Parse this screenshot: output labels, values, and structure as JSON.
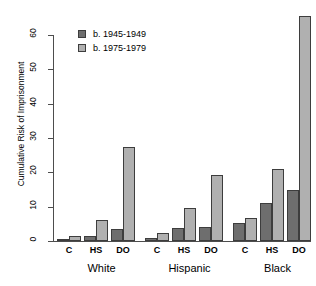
{
  "chart_data": {
    "type": "bar",
    "title": "",
    "xlabel": "",
    "ylabel": "Cumulative Risk of Imprisonment",
    "ylim": [
      0,
      68
    ],
    "yticks": [
      0,
      10,
      20,
      30,
      40,
      50,
      60
    ],
    "ytick_labels": [
      "0",
      "10",
      "20",
      "30",
      "40",
      "50",
      "60"
    ],
    "grid": false,
    "legend_position": "top-left",
    "categories": [
      "C",
      "HS",
      "DO",
      "C",
      "HS",
      "DO",
      "C",
      "HS",
      "DO"
    ],
    "groups": [
      {
        "name": "White",
        "categories": [
          "C",
          "HS",
          "DO"
        ]
      },
      {
        "name": "Hispanic",
        "categories": [
          "C",
          "HS",
          "DO"
        ]
      },
      {
        "name": "Black",
        "categories": [
          "C",
          "HS",
          "DO"
        ]
      }
    ],
    "series": [
      {
        "name": "b. 1945-1949",
        "color": "#6e6e6e",
        "values": [
          0.5,
          1.5,
          3.4,
          1.0,
          3.8,
          4.0,
          5.2,
          11.2,
          14.8
        ]
      },
      {
        "name": "b. 1975-1979",
        "color": "#b0b0b0",
        "values": [
          1.4,
          6.0,
          27.3,
          2.2,
          9.5,
          19.3,
          6.6,
          21.0,
          65.5
        ]
      }
    ]
  },
  "legend": {
    "items": [
      {
        "label": "b. 1945-1949",
        "color": "#6e6e6e"
      },
      {
        "label": "b. 1975-1979",
        "color": "#b0b0b0"
      }
    ]
  },
  "axes": {
    "y_title": "Cumulative Risk of Imprisonment",
    "y_tick_labels": [
      "0",
      "10",
      "20",
      "30",
      "40",
      "50",
      "60"
    ],
    "x_tick_labels": [
      "C",
      "HS",
      "DO",
      "C",
      "HS",
      "DO",
      "C",
      "HS",
      "DO"
    ],
    "group_labels": [
      "White",
      "Hispanic",
      "Black"
    ]
  }
}
